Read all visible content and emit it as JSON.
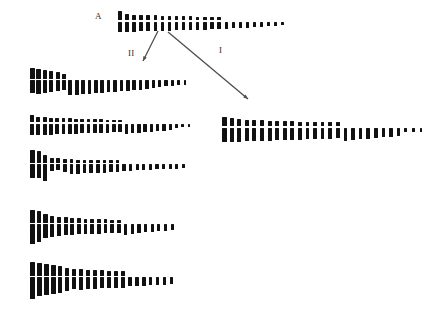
{
  "figure": {
    "background_color": "#ffffff",
    "chromosome_color": "#111111",
    "arrow_color": "#4d4d4d",
    "label_color": "#333333",
    "caption_labels": {
      "parent": "A",
      "arrow_left": "II",
      "arrow_right": "I"
    }
  },
  "labels": [
    {
      "name": "parent-label",
      "text": "A",
      "x": 95,
      "y": 12
    },
    {
      "name": "arrow-label-ii",
      "text": "II",
      "x": 128,
      "y": 49
    },
    {
      "name": "arrow-label-i",
      "text": "I",
      "x": 219,
      "y": 46
    }
  ],
  "arrows": [
    {
      "name": "arrow-ii",
      "label": "II",
      "x1": 158,
      "y1": 31,
      "x2": 143,
      "y2": 61,
      "head_size": 5
    },
    {
      "name": "arrow-i",
      "label": "I",
      "x1": 168,
      "y1": 32,
      "x2": 248,
      "y2": 99,
      "head_size": 5
    }
  ],
  "karyotypes": [
    {
      "name": "karyotype-parent-a",
      "id": "A",
      "x": 118,
      "baseline_y": 31,
      "pitch": 7.1,
      "count": 24,
      "chromosomes": [
        {
          "w": 4.2,
          "p": 9.0,
          "q": 10.0
        },
        {
          "w": 3.6,
          "p": 6.0,
          "q": 10.5
        },
        {
          "w": 3.6,
          "p": 5.5,
          "q": 10.0
        },
        {
          "w": 3.6,
          "p": 5.2,
          "q": 9.8
        },
        {
          "w": 3.6,
          "p": 5.0,
          "q": 9.6
        },
        {
          "w": 3.6,
          "p": 5.0,
          "q": 9.4
        },
        {
          "w": 3.5,
          "p": 4.6,
          "q": 9.2
        },
        {
          "w": 3.5,
          "p": 4.5,
          "q": 9.0
        },
        {
          "w": 3.5,
          "p": 4.2,
          "q": 8.8
        },
        {
          "w": 3.5,
          "p": 4.0,
          "q": 8.6
        },
        {
          "w": 3.4,
          "p": 4.0,
          "q": 8.4
        },
        {
          "w": 3.4,
          "p": 3.8,
          "q": 8.2
        },
        {
          "w": 3.4,
          "p": 3.6,
          "q": 8.0
        },
        {
          "w": 3.4,
          "p": 3.4,
          "q": 7.8
        },
        {
          "w": 3.3,
          "p": 3.2,
          "q": 7.6
        },
        {
          "w": 3.3,
          "p": 0.0,
          "q": 7.0
        },
        {
          "w": 3.3,
          "p": 0.0,
          "q": 6.6
        },
        {
          "w": 3.2,
          "p": 0.0,
          "q": 6.2
        },
        {
          "w": 3.2,
          "p": 0.0,
          "q": 6.0
        },
        {
          "w": 3.2,
          "p": 0.0,
          "q": 5.6
        },
        {
          "w": 3.1,
          "p": 0.0,
          "q": 5.2
        },
        {
          "w": 3.0,
          "p": 0.0,
          "q": 4.6
        },
        {
          "w": 2.9,
          "p": 0.0,
          "q": 4.2
        },
        {
          "w": 2.8,
          "p": 0.0,
          "q": 3.8
        }
      ]
    },
    {
      "name": "karyotype-left-1",
      "id": "L1",
      "x": 30,
      "baseline_y": 94,
      "pitch": 6.4,
      "count": 25,
      "chromosomes": [
        {
          "w": 4.6,
          "p": 11.0,
          "q": 13.0
        },
        {
          "w": 4.4,
          "p": 10.0,
          "q": 13.5
        },
        {
          "w": 4.4,
          "p": 9.0,
          "q": 12.5
        },
        {
          "w": 4.2,
          "p": 8.0,
          "q": 12.0
        },
        {
          "w": 4.0,
          "p": 7.0,
          "q": 11.0
        },
        {
          "w": 3.8,
          "p": 5.0,
          "q": 10.0
        },
        {
          "w": 3.8,
          "p": 0.0,
          "q": 15.0
        },
        {
          "w": 3.8,
          "p": 0.0,
          "q": 14.5
        },
        {
          "w": 3.8,
          "p": 0.0,
          "q": 14.0
        },
        {
          "w": 3.7,
          "p": 0.0,
          "q": 13.5
        },
        {
          "w": 3.7,
          "p": 0.0,
          "q": 13.0
        },
        {
          "w": 3.7,
          "p": 0.0,
          "q": 12.5
        },
        {
          "w": 3.7,
          "p": 0.0,
          "q": 12.0
        },
        {
          "w": 3.6,
          "p": 0.0,
          "q": 11.5
        },
        {
          "w": 3.6,
          "p": 0.0,
          "q": 11.0
        },
        {
          "w": 3.6,
          "p": 0.0,
          "q": 10.5
        },
        {
          "w": 3.6,
          "p": 0.0,
          "q": 10.0
        },
        {
          "w": 3.5,
          "p": 0.0,
          "q": 9.5
        },
        {
          "w": 3.5,
          "p": 0.0,
          "q": 9.0
        },
        {
          "w": 3.4,
          "p": 0.0,
          "q": 8.0
        },
        {
          "w": 3.3,
          "p": 0.0,
          "q": 7.0
        },
        {
          "w": 3.2,
          "p": 0.0,
          "q": 6.0
        },
        {
          "w": 3.1,
          "p": 0.0,
          "q": 5.5
        },
        {
          "w": 3.0,
          "p": 0.0,
          "q": 5.0
        },
        {
          "w": 2.9,
          "p": 0.0,
          "q": 4.5
        }
      ]
    },
    {
      "name": "karyotype-left-2",
      "id": "L2",
      "x": 30,
      "baseline_y": 134,
      "pitch": 6.3,
      "count": 26,
      "chromosomes": [
        {
          "w": 4.4,
          "p": 7.0,
          "q": 11.0
        },
        {
          "w": 4.0,
          "p": 5.0,
          "q": 11.5
        },
        {
          "w": 4.0,
          "p": 5.0,
          "q": 11.0
        },
        {
          "w": 4.0,
          "p": 4.5,
          "q": 11.0
        },
        {
          "w": 3.9,
          "p": 4.5,
          "q": 10.5
        },
        {
          "w": 3.9,
          "p": 4.0,
          "q": 10.5
        },
        {
          "w": 3.9,
          "p": 4.0,
          "q": 10.0
        },
        {
          "w": 3.8,
          "p": 3.5,
          "q": 10.0
        },
        {
          "w": 3.8,
          "p": 3.5,
          "q": 9.8
        },
        {
          "w": 3.8,
          "p": 3.2,
          "q": 9.6
        },
        {
          "w": 3.8,
          "p": 3.0,
          "q": 9.4
        },
        {
          "w": 3.7,
          "p": 3.0,
          "q": 9.2
        },
        {
          "w": 3.7,
          "p": 2.8,
          "q": 9.0
        },
        {
          "w": 3.7,
          "p": 2.5,
          "q": 8.8
        },
        {
          "w": 3.6,
          "p": 2.5,
          "q": 8.6
        },
        {
          "w": 3.6,
          "p": 0.0,
          "q": 10.5
        },
        {
          "w": 3.6,
          "p": 0.0,
          "q": 9.5
        },
        {
          "w": 3.5,
          "p": 0.0,
          "q": 9.0
        },
        {
          "w": 3.5,
          "p": 0.0,
          "q": 8.5
        },
        {
          "w": 3.4,
          "p": 0.0,
          "q": 8.0
        },
        {
          "w": 3.4,
          "p": 0.0,
          "q": 7.5
        },
        {
          "w": 3.3,
          "p": 0.0,
          "q": 7.0
        },
        {
          "w": 3.2,
          "p": 0.0,
          "q": 6.0
        },
        {
          "w": 3.0,
          "p": 0.0,
          "q": 4.0
        },
        {
          "w": 2.9,
          "p": 0.0,
          "q": 3.6
        },
        {
          "w": 2.8,
          "p": 0.0,
          "q": 3.4
        }
      ]
    },
    {
      "name": "karyotype-left-3",
      "id": "L3",
      "x": 30,
      "baseline_y": 180,
      "pitch": 6.6,
      "count": 24,
      "chromosomes": [
        {
          "w": 4.6,
          "p": 13.0,
          "q": 14.0
        },
        {
          "w": 4.4,
          "p": 12.0,
          "q": 14.0
        },
        {
          "w": 4.2,
          "p": 8.0,
          "q": 17.0
        },
        {
          "w": 3.8,
          "p": 4.5,
          "q": 6.5
        },
        {
          "w": 3.8,
          "p": 4.5,
          "q": 6.2
        },
        {
          "w": 3.7,
          "p": 4.0,
          "q": 8.0
        },
        {
          "w": 3.7,
          "p": 3.5,
          "q": 10.0
        },
        {
          "w": 3.7,
          "p": 3.2,
          "q": 9.5
        },
        {
          "w": 3.6,
          "p": 3.0,
          "q": 9.2
        },
        {
          "w": 3.6,
          "p": 3.0,
          "q": 9.0
        },
        {
          "w": 3.6,
          "p": 2.8,
          "q": 8.8
        },
        {
          "w": 3.5,
          "p": 2.6,
          "q": 8.6
        },
        {
          "w": 3.5,
          "p": 2.5,
          "q": 8.4
        },
        {
          "w": 3.5,
          "p": 2.4,
          "q": 8.2
        },
        {
          "w": 3.4,
          "p": 0.0,
          "q": 7.0
        },
        {
          "w": 3.4,
          "p": 0.0,
          "q": 6.6
        },
        {
          "w": 3.3,
          "p": 0.0,
          "q": 6.2
        },
        {
          "w": 3.3,
          "p": 0.0,
          "q": 6.0
        },
        {
          "w": 3.2,
          "p": 0.0,
          "q": 5.6
        },
        {
          "w": 3.2,
          "p": 0.0,
          "q": 5.4
        },
        {
          "w": 3.1,
          "p": 0.0,
          "q": 5.2
        },
        {
          "w": 3.0,
          "p": 0.0,
          "q": 5.0
        },
        {
          "w": 2.9,
          "p": 0.0,
          "q": 4.6
        },
        {
          "w": 2.8,
          "p": 0.0,
          "q": 4.2
        }
      ]
    },
    {
      "name": "karyotype-left-4",
      "id": "L4",
      "x": 30,
      "baseline_y": 243,
      "pitch": 6.7,
      "count": 22,
      "chromosomes": [
        {
          "w": 4.8,
          "p": 13.0,
          "q": 20.0
        },
        {
          "w": 4.6,
          "p": 12.0,
          "q": 18.0
        },
        {
          "w": 4.4,
          "p": 9.0,
          "q": 14.0
        },
        {
          "w": 4.2,
          "p": 7.0,
          "q": 13.0
        },
        {
          "w": 4.0,
          "p": 6.0,
          "q": 12.0
        },
        {
          "w": 4.0,
          "p": 5.5,
          "q": 11.0
        },
        {
          "w": 3.8,
          "p": 5.0,
          "q": 10.5
        },
        {
          "w": 3.8,
          "p": 4.5,
          "q": 10.0
        },
        {
          "w": 3.7,
          "p": 4.0,
          "q": 10.0
        },
        {
          "w": 3.7,
          "p": 4.0,
          "q": 9.5
        },
        {
          "w": 3.6,
          "p": 3.8,
          "q": 9.5
        },
        {
          "w": 3.6,
          "p": 3.5,
          "q": 9.0
        },
        {
          "w": 3.6,
          "p": 3.2,
          "q": 9.0
        },
        {
          "w": 3.5,
          "p": 3.0,
          "q": 8.5
        },
        {
          "w": 3.5,
          "p": 0.0,
          "q": 11.0
        },
        {
          "w": 3.4,
          "p": 0.0,
          "q": 10.0
        },
        {
          "w": 3.4,
          "p": 0.0,
          "q": 9.0
        },
        {
          "w": 3.3,
          "p": 0.0,
          "q": 8.0
        },
        {
          "w": 3.3,
          "p": 0.0,
          "q": 7.5
        },
        {
          "w": 3.2,
          "p": 0.0,
          "q": 7.0
        },
        {
          "w": 3.1,
          "p": 0.0,
          "q": 6.5
        },
        {
          "w": 3.0,
          "p": 0.0,
          "q": 6.0
        }
      ]
    },
    {
      "name": "karyotype-left-5",
      "id": "L5",
      "x": 30,
      "baseline_y": 298,
      "pitch": 7.0,
      "count": 21,
      "chromosomes": [
        {
          "w": 4.8,
          "p": 14.0,
          "q": 22.0
        },
        {
          "w": 4.8,
          "p": 13.0,
          "q": 19.0
        },
        {
          "w": 4.6,
          "p": 12.0,
          "q": 18.0
        },
        {
          "w": 4.6,
          "p": 11.0,
          "q": 17.0
        },
        {
          "w": 4.4,
          "p": 10.0,
          "q": 16.0
        },
        {
          "w": 4.2,
          "p": 8.0,
          "q": 14.0
        },
        {
          "w": 4.0,
          "p": 7.0,
          "q": 12.0
        },
        {
          "w": 4.0,
          "p": 7.0,
          "q": 13.0
        },
        {
          "w": 3.9,
          "p": 6.0,
          "q": 12.0
        },
        {
          "w": 3.9,
          "p": 6.0,
          "q": 11.5
        },
        {
          "w": 3.8,
          "p": 5.5,
          "q": 11.0
        },
        {
          "w": 3.8,
          "p": 5.0,
          "q": 11.0
        },
        {
          "w": 3.7,
          "p": 5.0,
          "q": 10.5
        },
        {
          "w": 3.7,
          "p": 4.5,
          "q": 10.5
        },
        {
          "w": 3.6,
          "p": 0.0,
          "q": 9.0
        },
        {
          "w": 3.6,
          "p": 0.0,
          "q": 8.5
        },
        {
          "w": 3.5,
          "p": 0.0,
          "q": 8.5
        },
        {
          "w": 3.4,
          "p": 0.0,
          "q": 8.0
        },
        {
          "w": 3.4,
          "p": 0.0,
          "q": 8.0
        },
        {
          "w": 3.3,
          "p": 0.0,
          "q": 7.5
        },
        {
          "w": 3.2,
          "p": 0.0,
          "q": 7.0
        }
      ]
    },
    {
      "name": "karyotype-right-1",
      "id": "R1",
      "x": 222,
      "baseline_y": 141,
      "pitch": 7.6,
      "count": 27,
      "chromosomes": [
        {
          "w": 4.6,
          "p": 9.0,
          "q": 14.0
        },
        {
          "w": 4.4,
          "p": 8.0,
          "q": 14.5
        },
        {
          "w": 4.2,
          "p": 7.0,
          "q": 14.0
        },
        {
          "w": 4.2,
          "p": 6.5,
          "q": 13.5
        },
        {
          "w": 4.0,
          "p": 6.0,
          "q": 13.5
        },
        {
          "w": 4.0,
          "p": 6.0,
          "q": 13.0
        },
        {
          "w": 4.0,
          "p": 5.5,
          "q": 13.0
        },
        {
          "w": 3.9,
          "p": 5.5,
          "q": 12.5
        },
        {
          "w": 3.9,
          "p": 5.0,
          "q": 12.5
        },
        {
          "w": 3.9,
          "p": 5.0,
          "q": 12.0
        },
        {
          "w": 3.8,
          "p": 4.8,
          "q": 12.0
        },
        {
          "w": 3.8,
          "p": 4.5,
          "q": 11.5
        },
        {
          "w": 3.8,
          "p": 4.5,
          "q": 11.5
        },
        {
          "w": 3.7,
          "p": 4.2,
          "q": 11.0
        },
        {
          "w": 3.7,
          "p": 4.0,
          "q": 11.0
        },
        {
          "w": 3.7,
          "p": 4.0,
          "q": 10.5
        },
        {
          "w": 3.6,
          "p": 0.0,
          "q": 13.0
        },
        {
          "w": 3.6,
          "p": 0.0,
          "q": 12.0
        },
        {
          "w": 3.6,
          "p": 0.0,
          "q": 11.5
        },
        {
          "w": 3.5,
          "p": 0.0,
          "q": 11.0
        },
        {
          "w": 3.5,
          "p": 0.0,
          "q": 10.0
        },
        {
          "w": 3.4,
          "p": 0.0,
          "q": 9.5
        },
        {
          "w": 3.4,
          "p": 0.0,
          "q": 9.0
        },
        {
          "w": 3.3,
          "p": 0.0,
          "q": 8.0
        },
        {
          "w": 3.0,
          "p": 0.0,
          "q": 4.5
        },
        {
          "w": 2.9,
          "p": 0.0,
          "q": 4.2
        },
        {
          "w": 2.8,
          "p": 0.0,
          "q": 4.0
        }
      ]
    }
  ]
}
